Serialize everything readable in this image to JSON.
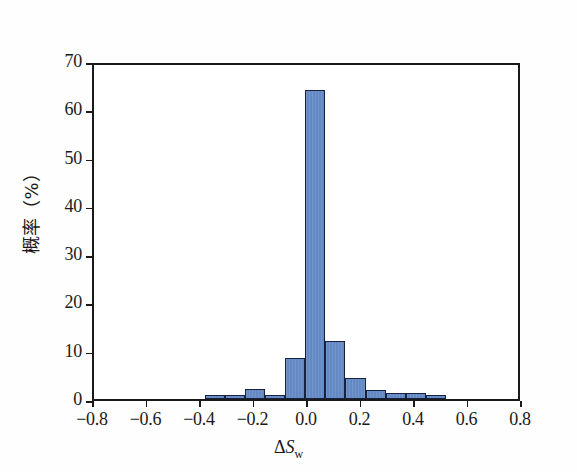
{
  "figure": {
    "background_color": "#fefefe",
    "frame_color": "#1c1a18"
  },
  "axes": {
    "x_title_prefix": "Δ",
    "x_title_var": "S",
    "x_title_sub": "w",
    "y_title": "概率（%）",
    "x_ticks": [
      "-0.8",
      "-0.6",
      "-0.4",
      "-0.2",
      "0.0",
      "0.2",
      "0.4",
      "0.6",
      "0.8"
    ],
    "y_ticks": [
      "0",
      "10",
      "20",
      "30",
      "40",
      "50",
      "60",
      "70"
    ]
  },
  "chart_data": {
    "type": "bar",
    "title": "",
    "subtitle": "",
    "xlabel": "ΔSw",
    "ylabel": "概率（%）",
    "xlim": [
      -0.8,
      0.8
    ],
    "ylim": [
      0,
      70
    ],
    "xtick_values": [
      -0.8,
      -0.6,
      -0.4,
      -0.2,
      0.0,
      0.2,
      0.4,
      0.6,
      0.8
    ],
    "ytick_values": [
      0,
      10,
      20,
      30,
      40,
      50,
      60,
      70
    ],
    "grid": false,
    "legend": null,
    "bar_fill_color": "#6389c4",
    "bar_edge_color": "#16213f",
    "bin_width": 0.075,
    "bins": [
      {
        "left": -0.385,
        "right": -0.31,
        "center": -0.3475,
        "value": 0.8
      },
      {
        "left": -0.31,
        "right": -0.235,
        "center": -0.2725,
        "value": 0.8
      },
      {
        "left": -0.235,
        "right": -0.16,
        "center": -0.1975,
        "value": 2.0
      },
      {
        "left": -0.16,
        "right": -0.085,
        "center": -0.1225,
        "value": 0.8
      },
      {
        "left": -0.085,
        "right": -0.01,
        "center": -0.0475,
        "value": 8.5
      },
      {
        "left": -0.01,
        "right": 0.065,
        "center": 0.0275,
        "value": 64.0
      },
      {
        "left": 0.065,
        "right": 0.14,
        "center": 0.1025,
        "value": 12.0
      },
      {
        "left": 0.14,
        "right": 0.215,
        "center": 0.1775,
        "value": 4.3
      },
      {
        "left": 0.215,
        "right": 0.29,
        "center": 0.2525,
        "value": 1.8
      },
      {
        "left": 0.29,
        "right": 0.365,
        "center": 0.3275,
        "value": 1.2
      },
      {
        "left": 0.365,
        "right": 0.44,
        "center": 0.4025,
        "value": 1.2
      },
      {
        "left": 0.44,
        "right": 0.515,
        "center": 0.4775,
        "value": 0.8
      }
    ]
  }
}
